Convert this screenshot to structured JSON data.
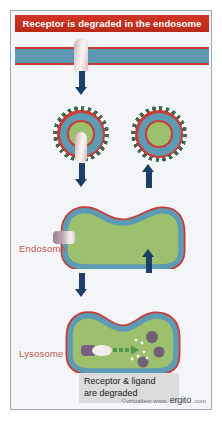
{
  "figure": {
    "title": "Receptor is degraded in the endosome",
    "caption": {
      "line1": "Receptor & ligand",
      "line2": "are degraded"
    },
    "copyright": {
      "prefix": "©virtualtext  www.",
      "brand": "ergito",
      "tld": ".com"
    },
    "labels": {
      "endosome": "Endosome",
      "lysosome": "Lysosome"
    },
    "colors": {
      "banner_red": "#c8301f",
      "membrane_red": "#cb3b33",
      "membrane_blue": "#5d9ab4",
      "lumen_green": "#9cc06e",
      "arrow_navy": "#1d3f67",
      "coat_green": "#3c6b52",
      "receptor_pink": "#f2e4e4",
      "receptor_purple": "#7b5e84",
      "vesicle_purple": "#6b4f78",
      "label_red": "#c2564b",
      "caption_bg": "#dcdcdc",
      "frame_border": "#a9a4c0",
      "panel_bg": "#f4f5f8"
    },
    "structures": [
      {
        "name": "plasma-membrane",
        "contains": "receptor"
      },
      {
        "name": "coated-vesicle-with-receptor"
      },
      {
        "name": "coated-vesicle-empty"
      },
      {
        "name": "endosome",
        "contains": "receptor"
      },
      {
        "name": "lysosome",
        "contains": "degraded receptor and ligand fragments"
      }
    ],
    "arrows": [
      {
        "name": "membrane-to-vesicle",
        "direction": "down"
      },
      {
        "name": "vesicle-to-endosome",
        "direction": "down"
      },
      {
        "name": "endosome-to-vesicle",
        "direction": "up"
      },
      {
        "name": "endosome-to-lysosome",
        "direction": "down"
      },
      {
        "name": "lysosome-to-endosome",
        "direction": "up"
      }
    ],
    "lysosome_contents": {
      "degradation_arrow": "dashed-green-arrow",
      "fragment_dots": 6,
      "vesicle_bodies": 3
    }
  }
}
